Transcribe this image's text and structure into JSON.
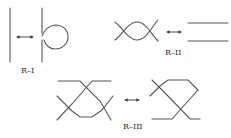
{
  "diagram": {
    "moves": [
      {
        "id": "R-I",
        "label": "R–I",
        "description": "Twist / untwist a loop in a single strand"
      },
      {
        "id": "R-II",
        "label": "R–II",
        "description": "Slide two strands over/under each other"
      },
      {
        "id": "R-III",
        "label": "R–III",
        "description": "Slide a strand across a crossing"
      }
    ],
    "equivalence_symbol": "double-headed-arrow",
    "colors": {
      "strand": "#555555",
      "arrow": "#333333",
      "background": "#ffffff"
    }
  }
}
